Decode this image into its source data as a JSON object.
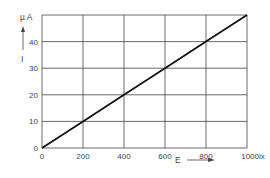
{
  "chart_data": {
    "type": "line",
    "title": "",
    "xlabel": "E",
    "ylabel": "I",
    "x_unit": "lx",
    "y_unit": "µA",
    "xlim": [
      0,
      1000
    ],
    "ylim": [
      0,
      50
    ],
    "x_ticks": [
      "0",
      "200",
      "400",
      "600",
      "800",
      "1000"
    ],
    "y_ticks": [
      "0",
      "10",
      "20",
      "30",
      "40"
    ],
    "grid": true,
    "legend": null,
    "series": [
      {
        "name": "I vs E",
        "x": [
          0,
          200,
          400,
          600,
          800,
          1000
        ],
        "values": [
          0,
          10,
          20,
          30,
          40,
          50
        ]
      }
    ]
  },
  "labels": {
    "y_unit": "µ A",
    "y_axis": "I",
    "x_axis": "E",
    "x_last_tick": "1000lx"
  }
}
